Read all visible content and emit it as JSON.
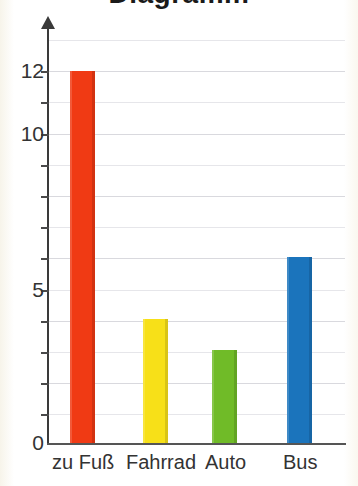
{
  "chart_data": {
    "type": "bar",
    "title": "",
    "xlabel": "",
    "ylabel": "",
    "categories": [
      "zu Fuß",
      "Fahrrad",
      "Auto",
      "Bus"
    ],
    "values": [
      12,
      4,
      3,
      6
    ],
    "series": [
      {
        "name": "Anzahl",
        "values": [
          12,
          4,
          3,
          6
        ]
      }
    ],
    "bar_colors": [
      "#f03a14",
      "#f7e018",
      "#70bb28",
      "#1b74bc"
    ],
    "ylim": [
      0,
      13
    ],
    "y_tick_labels": [
      "0",
      "5",
      "10",
      "12"
    ],
    "y_tick_values": [
      0,
      5,
      10,
      12
    ],
    "y_minor_step": 1,
    "grid": true,
    "grid_axis": "y",
    "legend": "none",
    "axis_arrow": "up"
  },
  "axis": {
    "y_labels": [
      {
        "text": "12",
        "value": 12
      },
      {
        "text": "10",
        "value": 10
      },
      {
        "text": "5",
        "value": 5
      },
      {
        "text": "0",
        "value": 0
      }
    ],
    "x_labels": [
      "zu Fuß",
      "Fahrrad",
      "Auto",
      "Bus"
    ]
  },
  "title": {
    "clipped_text": "Diagramm"
  },
  "colors": {
    "red": "#f03a14",
    "yellow": "#f7e018",
    "green": "#70bb28",
    "blue": "#1b74bc",
    "axis": "#3a3a3a",
    "grid": "#d9d9de",
    "text": "#333333",
    "background": "#ffffff"
  }
}
